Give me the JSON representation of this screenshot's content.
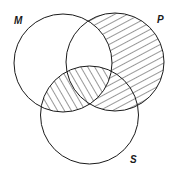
{
  "diagram": {
    "type": "venn",
    "sets": [
      {
        "id": "M",
        "label": "M",
        "cx": 63,
        "cy": 63,
        "r": 49,
        "label_x": 14,
        "label_y": 24
      },
      {
        "id": "P",
        "label": "P",
        "cx": 115,
        "cy": 62,
        "r": 49,
        "label_x": 157,
        "label_y": 23
      },
      {
        "id": "S",
        "label": "S",
        "cx": 89.5,
        "cy": 115,
        "r": 49,
        "label_x": 130,
        "label_y": 163
      }
    ],
    "shaded_regions": [
      {
        "region": "M∩S",
        "hatch": "steep-down-right"
      },
      {
        "region": "P−M",
        "hatch": "shallow-up-right"
      }
    ],
    "colors": {
      "stroke": "#1a1a1a",
      "background": "#ffffff"
    }
  }
}
